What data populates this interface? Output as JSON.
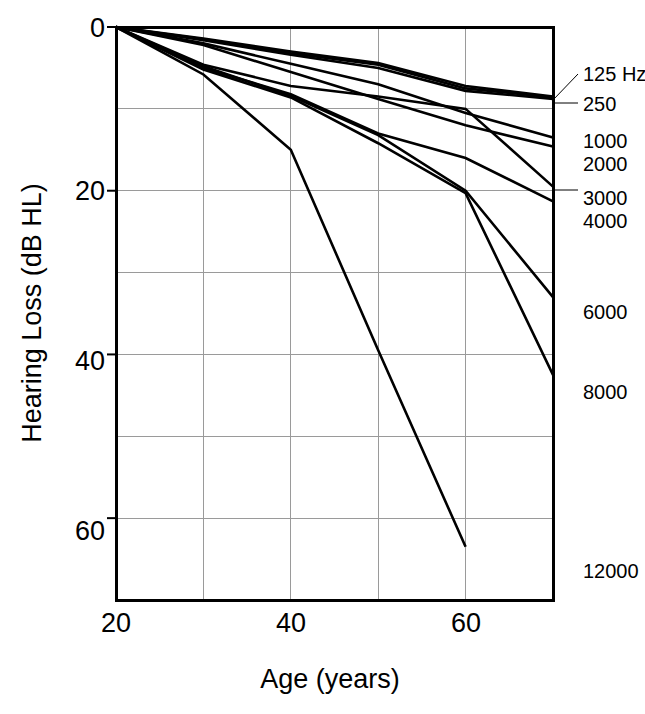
{
  "chart_data": {
    "type": "line",
    "title": "",
    "xlabel": "Age (years)",
    "ylabel": "Hearing Loss (dB HL)",
    "xlim": [
      20,
      70
    ],
    "ylim": [
      0,
      70
    ],
    "y_axis_inverted": true,
    "grid": true,
    "x_ticks_labeled": [
      "20",
      "40",
      "60"
    ],
    "x_tick_values_labeled": [
      20,
      40,
      60
    ],
    "x_gridline_values": [
      30,
      40,
      50,
      60
    ],
    "y_ticks_labeled": [
      "0",
      "20",
      "40",
      "60"
    ],
    "y_tick_values_labeled": [
      0,
      20,
      40,
      60
    ],
    "y_gridline_values": [
      10,
      20,
      30,
      40,
      50,
      60
    ],
    "legend_position": "right-of-axis-inline",
    "series": [
      {
        "name": "125 Hz",
        "label": "125 Hz",
        "label_y_db": 6.5,
        "x": [
          20,
          30,
          40,
          50,
          60,
          70
        ],
        "values": [
          0,
          1.5,
          3.2,
          4.6,
          7.5,
          8.6
        ]
      },
      {
        "name": "250",
        "label": "250",
        "label_y_db": 9.2,
        "x": [
          20,
          30,
          40,
          50,
          60,
          70
        ],
        "values": [
          0,
          1.6,
          3.4,
          5.0,
          7.8,
          8.8
        ]
      },
      {
        "name": "500",
        "label": "",
        "label_y_db": null,
        "x": [
          20,
          30,
          40,
          50,
          60,
          70
        ],
        "values": [
          0,
          1.4,
          3.0,
          4.4,
          7.2,
          8.5
        ]
      },
      {
        "name": "1000",
        "label": "1000",
        "label_y_db": 14.0,
        "x": [
          20,
          30,
          40,
          50,
          60,
          70
        ],
        "values": [
          0,
          2.0,
          4.5,
          7.0,
          10.5,
          13.5
        ]
      },
      {
        "name": "2000",
        "label": "2000",
        "label_y_db": 17.0,
        "x": [
          20,
          30,
          40,
          50,
          60,
          70
        ],
        "values": [
          0,
          2.2,
          5.5,
          8.8,
          12.0,
          14.6
        ]
      },
      {
        "name": "3000",
        "label": "3000",
        "label_y_db": 21.5,
        "x": [
          20,
          30,
          40,
          50,
          60,
          70
        ],
        "values": [
          0,
          4.6,
          7.2,
          8.5,
          10.0,
          19.5
        ]
      },
      {
        "name": "4000",
        "label": "4000",
        "label_y_db": 24.5,
        "x": [
          20,
          30,
          40,
          50,
          60,
          70
        ],
        "values": [
          0,
          5.0,
          8.2,
          13.0,
          16.0,
          21.3
        ]
      },
      {
        "name": "6000",
        "label": "6000",
        "label_y_db": 33.5,
        "x": [
          20,
          30,
          40,
          50,
          60,
          70
        ],
        "values": [
          0,
          4.8,
          8.4,
          13.2,
          20.0,
          33.0
        ]
      },
      {
        "name": "8000",
        "label": "8000",
        "label_y_db": 42.8,
        "x": [
          20,
          30,
          40,
          50,
          60,
          70
        ],
        "values": [
          0,
          5.2,
          8.6,
          14.2,
          20.3,
          42.5
        ]
      },
      {
        "name": "12000",
        "label": "12000",
        "label_y_db": 63.5,
        "x": [
          20,
          30,
          40,
          50,
          60
        ],
        "values": [
          0,
          5.8,
          15.0,
          39.5,
          63.5
        ]
      }
    ]
  },
  "axes": {
    "y_label": "Hearing Loss (dB HL)",
    "x_label": "Age (years)",
    "y_tick_0": "0",
    "y_tick_20": "20",
    "y_tick_40": "40",
    "y_tick_60": "60",
    "x_tick_20": "20",
    "x_tick_40": "40",
    "x_tick_60": "60"
  },
  "series_labels": {
    "s125": "125 Hz",
    "s250": "250",
    "s1000": "1000",
    "s2000": "2000",
    "s3000": "3000",
    "s4000": "4000",
    "s6000": "6000",
    "s8000": "8000",
    "s12000": "12000"
  },
  "colors": {
    "line": "#000000",
    "grid": "#9a9a9a",
    "frame": "#000000",
    "background": "#ffffff"
  }
}
